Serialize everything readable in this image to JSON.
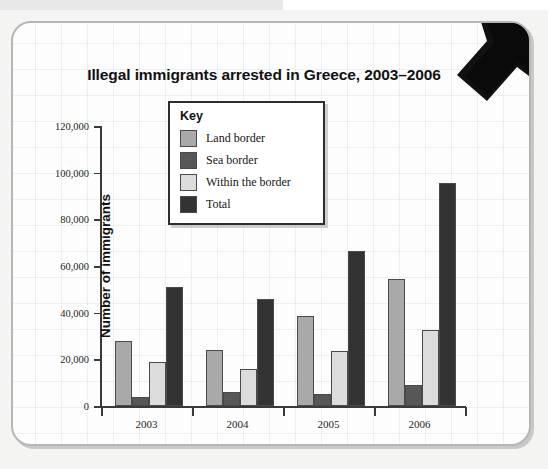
{
  "figure": {
    "corner_arrow_icon": "arrow-down-right-icon"
  },
  "legend": {
    "title": "Key",
    "entries": [
      {
        "label": "Land border",
        "color": "#a9a9a9"
      },
      {
        "label": "Sea border",
        "color": "#575757"
      },
      {
        "label": "Within the border",
        "color": "#dcdcdc"
      },
      {
        "label": "Total",
        "color": "#333333"
      }
    ]
  },
  "axis": {
    "y_ticks": [
      "0",
      "20,000",
      "40,000",
      "60,000",
      "80,000",
      "100,000",
      "120,000"
    ],
    "x_labels": [
      "2003",
      "2004",
      "2005",
      "2006"
    ]
  },
  "chart_data": {
    "type": "bar",
    "title": "Illegal immigrants arrested in Greece, 2003–2006",
    "xlabel": "Year",
    "ylabel": "Number of immigrants",
    "categories": [
      "2003",
      "2004",
      "2005",
      "2006"
    ],
    "series": [
      {
        "name": "Land border",
        "color": "#a9a9a9",
        "values": [
          28000,
          24000,
          38500,
          54500
        ]
      },
      {
        "name": "Sea border",
        "color": "#575757",
        "values": [
          4000,
          6000,
          5000,
          9000
        ]
      },
      {
        "name": "Within the border",
        "color": "#dcdcdc",
        "values": [
          19000,
          16000,
          23500,
          32500
        ]
      },
      {
        "name": "Total",
        "color": "#333333",
        "values": [
          51000,
          46000,
          66500,
          95500
        ]
      }
    ],
    "ylim": [
      0,
      120000
    ],
    "ytick_step": 20000,
    "grid": false,
    "legend_position": "top-center-inside"
  }
}
